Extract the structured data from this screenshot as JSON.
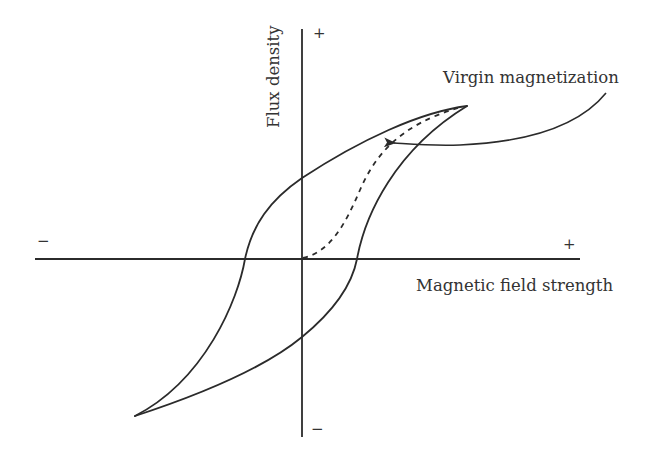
{
  "diagram": {
    "type": "hysteresis-loop",
    "colors": {
      "ink": "#2b2b2b",
      "text": "#333333",
      "background": "#ffffff"
    },
    "axes": {
      "x_label": "Magnetic field strength",
      "y_label": "Flux density",
      "x_positive_sign": "+",
      "x_negative_sign": "−",
      "y_positive_sign": "+",
      "y_negative_sign": "−",
      "origin": [
        302,
        259
      ],
      "x_range_px": [
        35,
        580
      ],
      "y_range_px": [
        29,
        437
      ]
    },
    "annotation": {
      "label": "Virgin magnetization",
      "arrow_from": [
        606,
        93
      ],
      "arrow_to": [
        392,
        143
      ]
    },
    "loop": {
      "positive_tip": [
        467,
        106
      ],
      "negative_tip": [
        135,
        416
      ],
      "remanence_positive_y": 178,
      "remanence_negative_y": 337,
      "coercivity_negative_x": 245,
      "coercivity_positive_x": 357
    },
    "virgin_curve": {
      "start": [
        303,
        258
      ],
      "end": [
        467,
        106
      ],
      "style": "dashed"
    }
  }
}
